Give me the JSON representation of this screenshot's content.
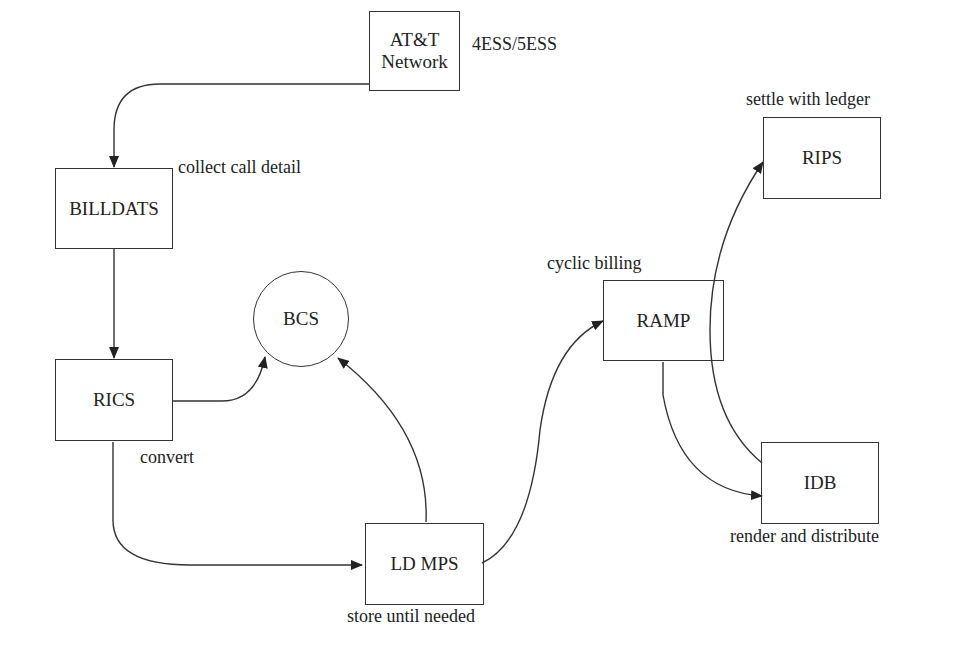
{
  "diagram": {
    "type": "flow",
    "nodes": [
      {
        "id": "att",
        "label": "AT&T\nNetwork",
        "shape": "rect"
      },
      {
        "id": "billdats",
        "label": "BILLDATS",
        "shape": "rect"
      },
      {
        "id": "rics",
        "label": "RICS",
        "shape": "rect"
      },
      {
        "id": "bcs",
        "label": "BCS",
        "shape": "circle"
      },
      {
        "id": "ldmps",
        "label": "LD MPS",
        "shape": "rect"
      },
      {
        "id": "ramp",
        "label": "RAMP",
        "shape": "rect"
      },
      {
        "id": "rips",
        "label": "RIPS",
        "shape": "rect"
      },
      {
        "id": "idb",
        "label": "IDB",
        "shape": "rect"
      }
    ],
    "annotations": {
      "att": "4ESS/5ESS",
      "billdats": "collect call detail",
      "rics": "convert",
      "ldmps": "store until needed",
      "ramp": "cyclic billing",
      "rips": "settle with ledger",
      "idb": "render and distribute"
    },
    "edges": [
      {
        "from": "att",
        "to": "billdats"
      },
      {
        "from": "billdats",
        "to": "rics"
      },
      {
        "from": "rics",
        "to": "bcs"
      },
      {
        "from": "rics",
        "to": "ldmps"
      },
      {
        "from": "ldmps",
        "to": "bcs"
      },
      {
        "from": "ldmps",
        "to": "ramp"
      },
      {
        "from": "ramp",
        "to": "idb"
      },
      {
        "from": "idb",
        "to": "rips"
      }
    ]
  }
}
